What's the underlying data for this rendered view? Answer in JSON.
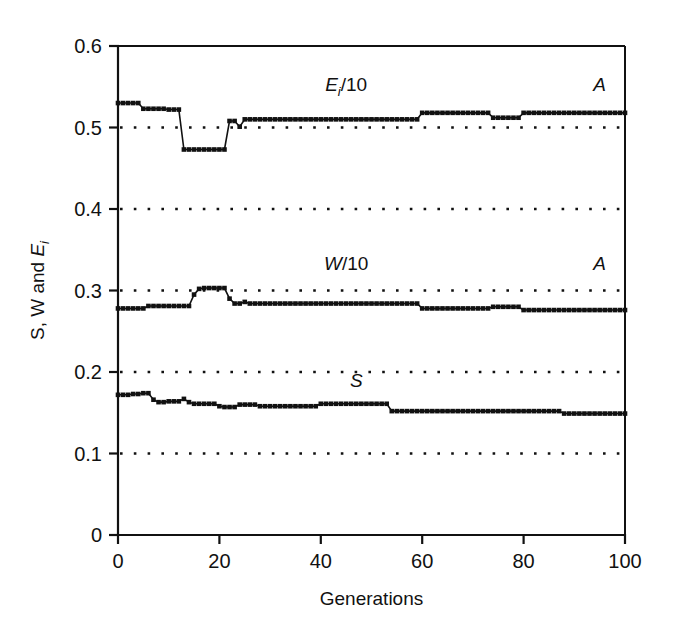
{
  "figure": {
    "background": "#ffffff",
    "ink_color": "#111111"
  },
  "chart_data": {
    "type": "line",
    "title": "",
    "xlabel": "Generations",
    "ylabel": "S, W and Ei",
    "ylabel_parts": {
      "prefix": "S, W and E",
      "subscript": "i"
    },
    "xlim": [
      0,
      100
    ],
    "ylim": [
      0,
      0.6
    ],
    "xticks": [
      0,
      20,
      40,
      60,
      80,
      100
    ],
    "xtick_labels": [
      "0",
      "20",
      "40",
      "60",
      "80",
      "100"
    ],
    "yticks": [
      0,
      0.1,
      0.2,
      0.3,
      0.4,
      0.5,
      0.6
    ],
    "ytick_labels": [
      "0",
      "0.1",
      "0.2",
      "0.3",
      "0.4",
      "0.5",
      "0.6"
    ],
    "grid": "horizontal dotted gridlines at 0.1, 0.2, 0.3, 0.4, 0.5",
    "gridlines": [
      0.1,
      0.2,
      0.3,
      0.4,
      0.5
    ],
    "legend": "inline labels on curves",
    "marker": "filled square",
    "annotations": [
      {
        "text": "A",
        "x": 95,
        "y": 0.545,
        "series": "Ei/10"
      },
      {
        "text": "A",
        "x": 95,
        "y": 0.325,
        "series": "W/10"
      }
    ],
    "series": [
      {
        "name": "Ei/10",
        "label_parts": {
          "prefix": "E",
          "subscript": "i",
          "suffix": "/10"
        },
        "label_x": 45,
        "label_y": 0.545,
        "x": [
          0,
          1,
          2,
          3,
          4,
          5,
          6,
          7,
          8,
          9,
          10,
          11,
          12,
          13,
          14,
          15,
          16,
          17,
          18,
          19,
          20,
          21,
          22,
          23,
          24,
          25,
          26,
          27,
          28,
          29,
          30,
          31,
          32,
          33,
          34,
          35,
          36,
          37,
          38,
          39,
          40,
          41,
          42,
          43,
          44,
          45,
          46,
          47,
          48,
          49,
          50,
          51,
          52,
          53,
          54,
          55,
          56,
          57,
          58,
          59,
          60,
          61,
          62,
          63,
          64,
          65,
          66,
          67,
          68,
          69,
          70,
          71,
          72,
          73,
          74,
          75,
          76,
          77,
          78,
          79,
          80,
          81,
          82,
          83,
          84,
          85,
          86,
          87,
          88,
          89,
          90,
          91,
          92,
          93,
          94,
          95,
          96,
          97,
          98,
          99,
          100
        ],
        "values": [
          0.53,
          0.53,
          0.53,
          0.53,
          0.53,
          0.523,
          0.523,
          0.523,
          0.523,
          0.523,
          0.522,
          0.522,
          0.522,
          0.473,
          0.473,
          0.473,
          0.473,
          0.473,
          0.473,
          0.473,
          0.473,
          0.473,
          0.508,
          0.508,
          0.501,
          0.51,
          0.51,
          0.51,
          0.51,
          0.51,
          0.51,
          0.51,
          0.51,
          0.51,
          0.51,
          0.51,
          0.51,
          0.51,
          0.51,
          0.51,
          0.51,
          0.51,
          0.51,
          0.51,
          0.51,
          0.51,
          0.51,
          0.51,
          0.51,
          0.51,
          0.51,
          0.51,
          0.51,
          0.51,
          0.51,
          0.51,
          0.51,
          0.51,
          0.51,
          0.51,
          0.518,
          0.518,
          0.518,
          0.518,
          0.518,
          0.518,
          0.518,
          0.518,
          0.518,
          0.518,
          0.518,
          0.518,
          0.518,
          0.518,
          0.512,
          0.512,
          0.512,
          0.512,
          0.512,
          0.512,
          0.518,
          0.518,
          0.518,
          0.518,
          0.518,
          0.518,
          0.518,
          0.518,
          0.518,
          0.518,
          0.518,
          0.518,
          0.518,
          0.518,
          0.518,
          0.518,
          0.518,
          0.518,
          0.518,
          0.518,
          0.518
        ]
      },
      {
        "name": "W/10",
        "label_parts": {
          "prefix": "W",
          "subscript": "",
          "suffix": "/10"
        },
        "label_x": 45,
        "label_y": 0.325,
        "x": [
          0,
          1,
          2,
          3,
          4,
          5,
          6,
          7,
          8,
          9,
          10,
          11,
          12,
          13,
          14,
          15,
          16,
          17,
          18,
          19,
          20,
          21,
          22,
          23,
          24,
          25,
          26,
          27,
          28,
          29,
          30,
          31,
          32,
          33,
          34,
          35,
          36,
          37,
          38,
          39,
          40,
          41,
          42,
          43,
          44,
          45,
          46,
          47,
          48,
          49,
          50,
          51,
          52,
          53,
          54,
          55,
          56,
          57,
          58,
          59,
          60,
          61,
          62,
          63,
          64,
          65,
          66,
          67,
          68,
          69,
          70,
          71,
          72,
          73,
          74,
          75,
          76,
          77,
          78,
          79,
          80,
          81,
          82,
          83,
          84,
          85,
          86,
          87,
          88,
          89,
          90,
          91,
          92,
          93,
          94,
          95,
          96,
          97,
          98,
          99,
          100
        ],
        "values": [
          0.278,
          0.278,
          0.278,
          0.278,
          0.278,
          0.278,
          0.281,
          0.281,
          0.281,
          0.281,
          0.281,
          0.281,
          0.281,
          0.281,
          0.281,
          0.295,
          0.302,
          0.303,
          0.303,
          0.303,
          0.303,
          0.303,
          0.29,
          0.284,
          0.284,
          0.286,
          0.284,
          0.284,
          0.284,
          0.284,
          0.284,
          0.284,
          0.284,
          0.284,
          0.284,
          0.284,
          0.284,
          0.284,
          0.284,
          0.284,
          0.284,
          0.284,
          0.284,
          0.284,
          0.284,
          0.284,
          0.284,
          0.284,
          0.284,
          0.284,
          0.284,
          0.284,
          0.284,
          0.284,
          0.284,
          0.284,
          0.284,
          0.284,
          0.284,
          0.284,
          0.278,
          0.278,
          0.278,
          0.278,
          0.278,
          0.278,
          0.278,
          0.278,
          0.278,
          0.278,
          0.278,
          0.278,
          0.278,
          0.278,
          0.28,
          0.28,
          0.28,
          0.28,
          0.28,
          0.28,
          0.276,
          0.276,
          0.276,
          0.276,
          0.276,
          0.276,
          0.276,
          0.276,
          0.276,
          0.276,
          0.276,
          0.276,
          0.276,
          0.276,
          0.276,
          0.276,
          0.276,
          0.276,
          0.276,
          0.276,
          0.276
        ]
      },
      {
        "name": "S",
        "label_parts": {
          "prefix": "S",
          "subscript": "",
          "suffix": ""
        },
        "label_x": 47,
        "label_y": 0.182,
        "x": [
          0,
          1,
          2,
          3,
          4,
          5,
          6,
          7,
          8,
          9,
          10,
          11,
          12,
          13,
          14,
          15,
          16,
          17,
          18,
          19,
          20,
          21,
          22,
          23,
          24,
          25,
          26,
          27,
          28,
          29,
          30,
          31,
          32,
          33,
          34,
          35,
          36,
          37,
          38,
          39,
          40,
          41,
          42,
          43,
          44,
          45,
          46,
          47,
          48,
          49,
          50,
          51,
          52,
          53,
          54,
          55,
          56,
          57,
          58,
          59,
          60,
          61,
          62,
          63,
          64,
          65,
          66,
          67,
          68,
          69,
          70,
          71,
          72,
          73,
          74,
          75,
          76,
          77,
          78,
          79,
          80,
          81,
          82,
          83,
          84,
          85,
          86,
          87,
          88,
          89,
          90,
          91,
          92,
          93,
          94,
          95,
          96,
          97,
          98,
          99,
          100
        ],
        "values": [
          0.172,
          0.172,
          0.172,
          0.173,
          0.173,
          0.174,
          0.174,
          0.166,
          0.163,
          0.163,
          0.164,
          0.164,
          0.164,
          0.167,
          0.163,
          0.161,
          0.161,
          0.161,
          0.161,
          0.161,
          0.158,
          0.157,
          0.157,
          0.157,
          0.16,
          0.16,
          0.16,
          0.16,
          0.158,
          0.158,
          0.158,
          0.158,
          0.158,
          0.158,
          0.158,
          0.158,
          0.158,
          0.158,
          0.158,
          0.158,
          0.161,
          0.161,
          0.161,
          0.161,
          0.161,
          0.161,
          0.161,
          0.161,
          0.161,
          0.161,
          0.161,
          0.161,
          0.161,
          0.161,
          0.152,
          0.152,
          0.152,
          0.152,
          0.152,
          0.152,
          0.152,
          0.152,
          0.152,
          0.152,
          0.152,
          0.152,
          0.152,
          0.152,
          0.152,
          0.152,
          0.152,
          0.152,
          0.152,
          0.152,
          0.152,
          0.152,
          0.152,
          0.152,
          0.152,
          0.152,
          0.152,
          0.152,
          0.152,
          0.152,
          0.152,
          0.152,
          0.152,
          0.152,
          0.149,
          0.149,
          0.149,
          0.149,
          0.149,
          0.149,
          0.149,
          0.149,
          0.149,
          0.149,
          0.149,
          0.149,
          0.149
        ]
      }
    ]
  }
}
